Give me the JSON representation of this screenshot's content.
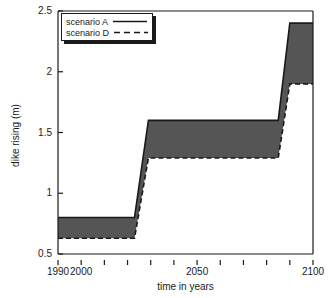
{
  "chart_data": {
    "type": "area",
    "title": "",
    "xlabel": "time in years",
    "ylabel": "dike rising (m)",
    "xlim": [
      1990,
      2100
    ],
    "ylim": [
      0.5,
      2.5
    ],
    "grid": false,
    "legend_position": "top-left",
    "xticks": [
      1990,
      2000,
      2010,
      2020,
      2030,
      2040,
      2050,
      2060,
      2070,
      2080,
      2090,
      2100
    ],
    "xtick_labels": [
      "1990",
      "2000",
      "",
      "",
      "",
      "",
      "2050",
      "",
      "",
      "",
      "",
      "2100"
    ],
    "yticks": [
      0.5,
      1,
      1.5,
      2,
      2.5
    ],
    "ytick_labels": [
      "0.5",
      "1",
      "1.5",
      "2",
      "2.5"
    ],
    "fill_color": "#555555",
    "series": [
      {
        "name": "scenario A",
        "style": "solid",
        "color": "#1a1a1a",
        "x": [
          1990,
          2023,
          2029,
          2085,
          2090,
          2100
        ],
        "values": [
          0.8,
          0.8,
          1.6,
          1.6,
          2.4,
          2.4
        ]
      },
      {
        "name": "scenario D",
        "style": "dashed",
        "color": "#1a1a1a",
        "x": [
          1990,
          2023,
          2029,
          2085,
          2090,
          2100
        ],
        "values": [
          0.63,
          0.63,
          1.29,
          1.29,
          1.9,
          1.9
        ]
      }
    ],
    "legend": [
      {
        "label": "scenario A",
        "style": "solid"
      },
      {
        "label": "scenario D",
        "style": "dashed"
      }
    ]
  }
}
